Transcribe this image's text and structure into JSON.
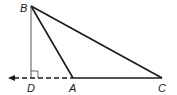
{
  "diagram": {
    "type": "geometry-triangle",
    "points": {
      "B": {
        "label": "B",
        "x": 31,
        "y": 6
      },
      "D": {
        "label": "D",
        "x": 31,
        "y": 78
      },
      "A": {
        "label": "A",
        "x": 73,
        "y": 78
      },
      "C": {
        "label": "C",
        "x": 162,
        "y": 78
      }
    },
    "segments": [
      {
        "from": "B",
        "to": "C",
        "style": "solid"
      },
      {
        "from": "B",
        "to": "A",
        "style": "solid"
      },
      {
        "from": "A",
        "to": "C",
        "style": "solid"
      },
      {
        "from": "B",
        "to": "D",
        "style": "solid-thin"
      },
      {
        "from": "A",
        "to": "D",
        "style": "dashed"
      }
    ],
    "ray_arrow": {
      "direction": "left",
      "from": "D",
      "icon": "arrow-left-icon"
    },
    "right_angle_marker": {
      "at": "D"
    },
    "colors": {
      "line": "#1a1a1a",
      "altitude": "#555555",
      "background": "#ffffff"
    }
  }
}
